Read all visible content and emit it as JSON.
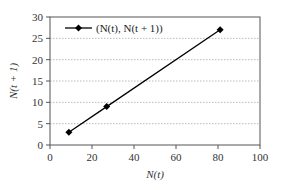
{
  "chart_data": {
    "type": "line",
    "title": "",
    "xlabel": "N(t)",
    "ylabel": "N(t + 1)",
    "xlim": [
      0,
      100
    ],
    "ylim": [
      0,
      30
    ],
    "x_ticks": [
      0,
      20,
      40,
      60,
      80,
      100
    ],
    "y_ticks": [
      0,
      5,
      10,
      15,
      20,
      25,
      30
    ],
    "grid": "horizontal dotted",
    "legend_position": "top-left inside",
    "series": [
      {
        "name": "(N(t), N(t + 1))",
        "marker": "diamond",
        "color": "#000000",
        "x": [
          9,
          27,
          81
        ],
        "y": [
          3,
          9,
          27
        ]
      }
    ]
  },
  "labels": {
    "xlabel": "N(t)",
    "ylabel": "N(t + 1)",
    "legend": "(N(t), N(t + 1))",
    "x_ticks": [
      "0",
      "20",
      "40",
      "60",
      "80",
      "100"
    ],
    "y_ticks": [
      "0",
      "5",
      "10",
      "15",
      "20",
      "25",
      "30"
    ]
  }
}
